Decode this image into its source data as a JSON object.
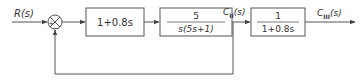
{
  "diagram": {
    "type": "block-diagram",
    "input": {
      "label": "R(s)"
    },
    "summing_junction": {
      "signs": {
        "left": "+",
        "bottom": "−"
      }
    },
    "blocks": [
      {
        "id": "block-1",
        "tf": "1+0.8s"
      },
      {
        "id": "block-2",
        "numerator": "5",
        "denominator": "s(5s+1)"
      },
      {
        "id": "block-3",
        "numerator": "1",
        "denominator": "1+0.8s"
      }
    ],
    "signals": {
      "c2": {
        "base": "C",
        "sub": "II",
        "arg": "(s)"
      },
      "c3": {
        "base": "C",
        "sub": "III",
        "arg": "(s)"
      }
    },
    "feedback": "unity negative feedback from C_II(s) to summing junction"
  },
  "colors": {
    "stroke": "#555555",
    "text": "#333333"
  }
}
